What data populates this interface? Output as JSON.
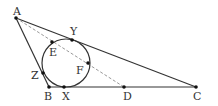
{
  "diagram": {
    "type": "geometry",
    "colors": {
      "line": "#333333",
      "dashed": "#999999",
      "point": "#111111",
      "label": "#333333"
    },
    "points": {
      "A": {
        "label": "A",
        "x": 16,
        "y": 18
      },
      "B": {
        "label": "B",
        "x": 49,
        "y": 87
      },
      "C": {
        "label": "C",
        "x": 196,
        "y": 87
      },
      "D": {
        "label": "D",
        "x": 124,
        "y": 87
      },
      "X": {
        "label": "X",
        "x": 64,
        "y": 87
      },
      "Y": {
        "label": "Y",
        "x": 72,
        "y": 40
      },
      "Z": {
        "label": "Z",
        "x": 43,
        "y": 73
      },
      "E": {
        "label": "E",
        "x": 52,
        "y": 42
      },
      "F": {
        "label": "F",
        "x": 88,
        "y": 63
      }
    },
    "circle": {
      "cx": 66,
      "cy": 63,
      "r": 24
    },
    "segments": [
      "AB",
      "BC",
      "CA"
    ],
    "dashed_segments": [
      "AD"
    ]
  }
}
